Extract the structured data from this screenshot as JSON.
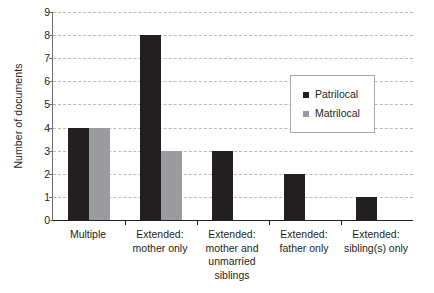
{
  "chart_data": {
    "type": "bar",
    "title": "",
    "xlabel": "",
    "ylabel": "Number of documents",
    "ylim": [
      0,
      9
    ],
    "yticks": [
      0,
      1,
      2,
      3,
      4,
      5,
      6,
      7,
      8,
      9
    ],
    "grid": true,
    "grid_style": "dashed horizontal",
    "legend_position": "inside upper right",
    "categories": [
      "Multiple",
      "Extended:\nmother only",
      "Extended:\nmother and\nunmarried\nsiblings",
      "Extended:\nfather only",
      "Extended:\nsibling(s) only"
    ],
    "series": [
      {
        "name": "Patrilocal",
        "color": "#231f20",
        "values": [
          4,
          8,
          3,
          2,
          1
        ]
      },
      {
        "name": "Matrilocal",
        "color": "#9a9b9e",
        "values": [
          4,
          3,
          0,
          0,
          0
        ]
      }
    ]
  },
  "axes": {
    "y_title": "Number of documents",
    "y_tick_labels": [
      "9",
      "8",
      "7",
      "6",
      "5",
      "4",
      "3",
      "2",
      "1",
      "0"
    ],
    "x_tick_labels": [
      [
        "Multiple"
      ],
      [
        "Extended:",
        "mother only"
      ],
      [
        "Extended:",
        "mother and",
        "unmarried",
        "siblings"
      ],
      [
        "Extended:",
        "father only"
      ],
      [
        "Extended:",
        "sibling(s) only"
      ]
    ]
  },
  "legend": {
    "entries": [
      {
        "label": "Patrilocal",
        "swatch": "black-square-marker"
      },
      {
        "label": "Matrilocal",
        "swatch": "gray-square-marker"
      }
    ]
  },
  "colors": {
    "patrilocal": "#231f20",
    "matrilocal": "#9a9b9e",
    "gridline": "#b9bbbd",
    "axis": "#231f20",
    "legend_border": "#a7a9ac",
    "background": "#ffffff",
    "text": "#231f20"
  }
}
